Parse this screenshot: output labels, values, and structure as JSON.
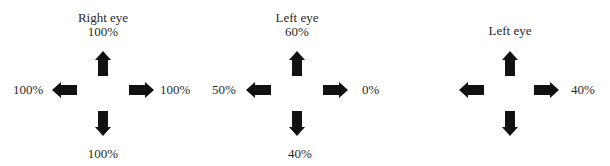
{
  "panels": [
    {
      "title": "Right eye",
      "up": "100%",
      "left": "100%",
      "right": "100%",
      "down": "100%"
    },
    {
      "title": "Left eye",
      "up": "60%",
      "left": "50%",
      "right": "0%",
      "down": "40%"
    },
    {
      "title": "Left eye",
      "up": "",
      "left": "",
      "right": "40%",
      "down": ""
    }
  ],
  "icons": {
    "up": "arrow-up-icon",
    "down": "arrow-down-icon",
    "left": "arrow-left-icon",
    "right": "arrow-right-icon"
  },
  "colors": {
    "arrow": "#111111",
    "text": "#2a2a2a",
    "background": "#ffffff"
  }
}
